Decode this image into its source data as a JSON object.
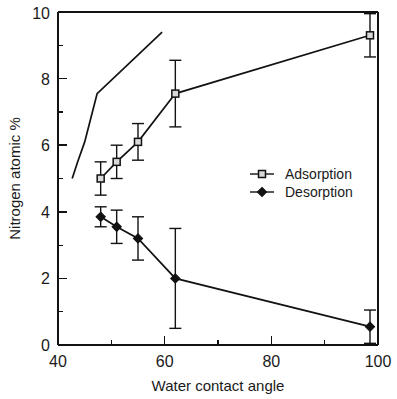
{
  "chart_data": {
    "type": "scatter",
    "title": "",
    "xlabel": "Water contact angle",
    "ylabel": "Nitrogen atomic %",
    "xlim": [
      40,
      100
    ],
    "ylim": [
      0,
      10
    ],
    "xticks": [
      40,
      60,
      80,
      100
    ],
    "yticks": [
      0,
      2,
      4,
      6,
      8,
      10
    ],
    "xticks_minor": [
      50,
      70,
      90
    ],
    "yticks_minor": [
      1,
      3,
      5,
      7,
      9
    ],
    "grid": false,
    "legend_position": "center-right",
    "series": [
      {
        "name": "Adsorption",
        "marker": "open-square",
        "x": [
          48,
          51,
          55,
          62,
          98.5
        ],
        "values": [
          5.0,
          5.5,
          6.1,
          7.55,
          9.3
        ],
        "yerr": [
          0.5,
          0.5,
          0.55,
          1.0,
          0.65
        ]
      },
      {
        "name": "Desorption",
        "marker": "filled-diamond",
        "x": [
          48,
          51,
          55,
          62,
          98.5
        ],
        "values": [
          3.85,
          3.55,
          3.2,
          2.0,
          0.55
        ],
        "yerr": [
          0.3,
          0.5,
          0.65,
          1.5,
          0.5
        ]
      }
    ]
  },
  "axes": {
    "x_tick_labels": [
      "40",
      "60",
      "80",
      "100"
    ],
    "y_tick_labels": [
      "0",
      "2",
      "4",
      "6",
      "8",
      "10"
    ],
    "x_title": "Water contact angle",
    "y_title": "Nitrogen atomic %"
  },
  "legend": {
    "entries": [
      {
        "label": "Adsorption",
        "marker": "open-square"
      },
      {
        "label": "Desorption",
        "marker": "filled-diamond"
      }
    ]
  },
  "colors": {
    "ink": "#121212",
    "background": "#ffffff",
    "marker_fill": "#d9d9d9"
  }
}
